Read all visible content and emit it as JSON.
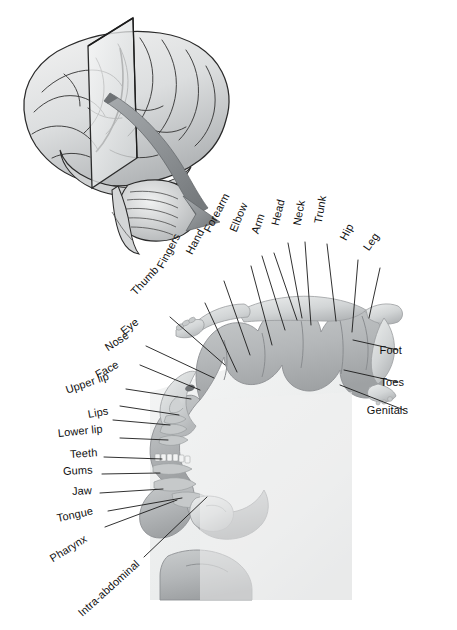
{
  "figure": {
    "palette": {
      "ink": "#101010",
      "leader_line": "#1a1a1a",
      "cortex_ribbon": "#b9bcbd",
      "cortex_ribbon_dark": "#a3a7a9",
      "section_fill": "#eceeee",
      "brain_fill": "#e4e5e6",
      "brain_shadow": "#9fa2a4",
      "brain_outline": "#2a2a2a",
      "plane_fill": "#e8eaea",
      "plane_edge": "#2b2b2b",
      "arrow_fill": "#8d9194",
      "arrow_edge": "#5d6164",
      "body_fill": "#d7d9da",
      "background": "#ffffff"
    },
    "panels": [
      {
        "name": "brain-lateral-view",
        "description": "Lateral view of the cerebral hemisphere with cerebellum and brainstem",
        "annotations": [
          "sectioning-plane",
          "curved-arrow"
        ]
      },
      {
        "name": "coronal-section",
        "description": "Coronal section through the postcentral gyrus showing the somatosensory homunculus"
      }
    ]
  },
  "labels": {
    "top": [
      {
        "text": "Fingers",
        "x": 160,
        "y": 268,
        "rot": -62,
        "lx": 205,
        "ly": 303,
        "tx": 237,
        "ty": 372
      },
      {
        "text": "Hand",
        "x": 189,
        "y": 254,
        "rot": -62,
        "lx": 224,
        "ly": 281,
        "tx": 250,
        "ty": 355
      },
      {
        "text": "Forearm",
        "x": 207,
        "y": 232,
        "rot": -62,
        "lx": 251,
        "ly": 266,
        "tx": 272,
        "ty": 345
      },
      {
        "text": "Elbow",
        "x": 233,
        "y": 232,
        "rot": -68,
        "lx": 262,
        "ly": 256,
        "tx": 285,
        "ty": 330
      },
      {
        "text": "Arm",
        "x": 255,
        "y": 234,
        "rot": -72,
        "lx": 274,
        "ly": 253,
        "tx": 297,
        "ty": 320
      },
      {
        "text": "Head",
        "x": 275,
        "y": 226,
        "rot": -76,
        "lx": 288,
        "ly": 243,
        "tx": 302,
        "ty": 318
      },
      {
        "text": "Neck",
        "x": 297,
        "y": 226,
        "rot": -80,
        "lx": 305,
        "ly": 242,
        "tx": 311,
        "ty": 325
      },
      {
        "text": "Trunk",
        "x": 318,
        "y": 224,
        "rot": -80,
        "lx": 327,
        "ly": 244,
        "tx": 336,
        "ty": 321
      },
      {
        "text": "Hip",
        "x": 343,
        "y": 240,
        "rot": -62,
        "lx": 358,
        "ly": 260,
        "tx": 352,
        "ty": 332
      },
      {
        "text": "Leg",
        "x": 366,
        "y": 250,
        "rot": -55,
        "lx": 380,
        "ly": 268,
        "tx": 369,
        "ty": 318
      }
    ],
    "left": [
      {
        "text": "Thumb",
        "x": 133,
        "y": 294,
        "rot": -47,
        "lx": 170,
        "ly": 317,
        "tx": 225,
        "ty": 365
      },
      {
        "text": "Eye",
        "x": 122,
        "y": 333,
        "rot": -38,
        "lx": 146,
        "ly": 346,
        "tx": 214,
        "ty": 378
      },
      {
        "text": "Nose",
        "x": 106,
        "y": 349,
        "rot": -33,
        "lx": 140,
        "ly": 365,
        "tx": 200,
        "ty": 390
      },
      {
        "text": "Face",
        "x": 96,
        "y": 376,
        "rot": -28,
        "lx": 126,
        "ly": 389,
        "tx": 191,
        "ty": 399
      },
      {
        "text": "Upper lip",
        "x": 66,
        "y": 391,
        "rot": -19,
        "lx": 120,
        "ly": 406,
        "tx": 179,
        "ty": 415
      },
      {
        "text": "Lips",
        "x": 88,
        "y": 415,
        "rot": -10,
        "lx": 113,
        "ly": 420,
        "tx": 170,
        "ty": 425
      },
      {
        "text": "Lower lip",
        "x": 58,
        "y": 434,
        "rot": -6,
        "lx": 120,
        "ly": 438,
        "tx": 168,
        "ty": 440
      },
      {
        "text": "Teeth",
        "x": 70,
        "y": 455,
        "rot": -4,
        "lx": 104,
        "ly": 457,
        "tx": 162,
        "ty": 459
      },
      {
        "text": "Gums",
        "x": 63,
        "y": 472,
        "rot": -3,
        "lx": 102,
        "ly": 474,
        "tx": 160,
        "ty": 473
      },
      {
        "text": "Jaw",
        "x": 72,
        "y": 492,
        "rot": -3,
        "lx": 100,
        "ly": 493,
        "tx": 163,
        "ty": 489
      },
      {
        "text": "Tongue",
        "x": 57,
        "y": 519,
        "rot": -12,
        "lx": 108,
        "ly": 511,
        "tx": 182,
        "ty": 498
      },
      {
        "text": "Pharynx",
        "x": 51,
        "y": 560,
        "rot": -32,
        "lx": 105,
        "ly": 527,
        "tx": 177,
        "ty": 500
      },
      {
        "text": "Intra-abdominal",
        "x": 80,
        "y": 615,
        "rot": -42,
        "lx": 144,
        "ly": 557,
        "tx": 207,
        "ty": 497
      }
    ],
    "right": [
      {
        "text": "Foot",
        "x": 402,
        "y": 351,
        "rot": 0,
        "lx": 398,
        "ly": 350,
        "tx": 353,
        "ty": 340
      },
      {
        "text": "Toes",
        "x": 404,
        "y": 383,
        "rot": 0,
        "lx": 398,
        "ly": 382,
        "tx": 344,
        "ty": 370
      },
      {
        "text": "Genitals",
        "x": 408,
        "y": 411,
        "rot": 0,
        "lx": 404,
        "ly": 410,
        "tx": 340,
        "ty": 385
      }
    ]
  },
  "homunculus": {
    "body_parts_order": [
      "Intra-abdominal",
      "Pharynx",
      "Tongue",
      "Jaw",
      "Gums",
      "Teeth",
      "Lower lip",
      "Lips",
      "Upper lip",
      "Face",
      "Nose",
      "Eye",
      "Thumb",
      "Fingers",
      "Hand",
      "Forearm",
      "Elbow",
      "Arm",
      "Head",
      "Neck",
      "Trunk",
      "Hip",
      "Leg",
      "Foot",
      "Toes",
      "Genitals"
    ],
    "label_count": 26
  }
}
